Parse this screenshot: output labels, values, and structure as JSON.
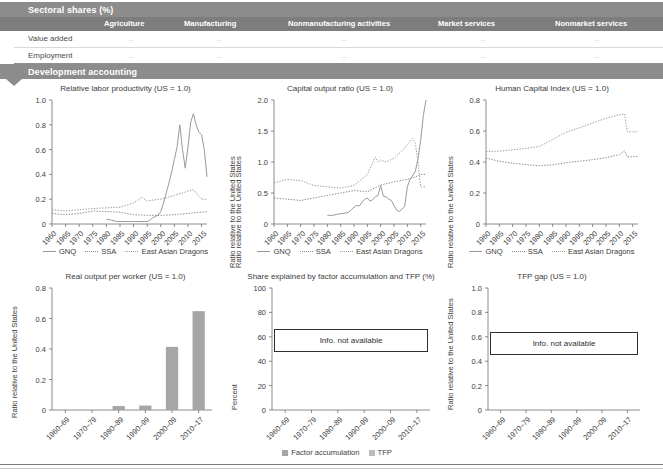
{
  "sections": {
    "sectoral": {
      "title": "Sectoral shares (%)"
    },
    "development": {
      "title": "Development accounting"
    }
  },
  "table": {
    "columns": [
      "Agriculture",
      "Manufacturing",
      "Nonmanufacturing activities",
      "Market services",
      "Nonmarket services"
    ],
    "rows": [
      {
        "label": "Value added",
        "values": [
          "..",
          "..",
          "..",
          "..",
          ".."
        ]
      },
      {
        "label": "Employment",
        "values": [
          "..",
          "..",
          "..",
          "..",
          ".."
        ]
      }
    ]
  },
  "line_legend": {
    "gnq": "GNQ",
    "ssa": "SSA",
    "dragons": "East Asian Dragons"
  },
  "bar_legend": {
    "factor": "Factor accumulation",
    "tfp": "TFP"
  },
  "not_available_text": "Info. not available",
  "colors": {
    "banner": "#8c8c8c",
    "table_header": "#7d7d7d",
    "gnq_line": "#9a9a9a",
    "ssa_line": "#8a8a8a",
    "dragons_line": "#9e9e9e",
    "bar_fill": "#a6a6a6",
    "text": "#3d3d3d"
  },
  "chart_data": [
    {
      "id": "relative-labor-productivity",
      "type": "line",
      "title": "Relative labor productivity (US = 1.0)",
      "xlabel": "",
      "ylabel": "Ratio relative to the United States",
      "ylim": [
        0,
        1.0
      ],
      "yticks": [
        "0",
        "0.2",
        "0.4",
        "0.6",
        "0.8",
        "1.0"
      ],
      "ytick_values": [
        0,
        0.2,
        0.4,
        0.6,
        0.8,
        1.0
      ],
      "xticks": [
        "1960",
        "1965",
        "1970",
        "1975",
        "1980",
        "1985",
        "1990",
        "1995",
        "2000",
        "2005",
        "2010",
        "2015"
      ],
      "xlim": [
        1960,
        2017
      ],
      "grid": false,
      "legend_position": "bottom",
      "series": [
        {
          "name": "GNQ",
          "style": "solid",
          "x": [
            1980,
            1982,
            1984,
            1986,
            1988,
            1990,
            1992,
            1994,
            1995,
            1996,
            1997,
            1998,
            1999,
            2000,
            2001,
            2002,
            2003,
            2004,
            2005,
            2006,
            2007,
            2008,
            2009,
            2010,
            2011,
            2012,
            2013,
            2014,
            2015,
            2016,
            2017
          ],
          "values": [
            0.04,
            0.03,
            0.02,
            0.02,
            0.02,
            0.02,
            0.02,
            0.02,
            0.02,
            0.03,
            0.05,
            0.06,
            0.07,
            0.1,
            0.17,
            0.25,
            0.33,
            0.42,
            0.52,
            0.62,
            0.8,
            0.6,
            0.45,
            0.62,
            0.82,
            0.89,
            0.8,
            0.74,
            0.72,
            0.6,
            0.38
          ]
        },
        {
          "name": "SSA",
          "style": "dotted",
          "x": [
            1960,
            1965,
            1970,
            1975,
            1980,
            1985,
            1990,
            1995,
            2000,
            2005,
            2010,
            2015,
            2017
          ],
          "values": [
            0.085,
            0.075,
            0.085,
            0.105,
            0.1,
            0.095,
            0.075,
            0.07,
            0.07,
            0.075,
            0.085,
            0.095,
            0.1
          ]
        },
        {
          "name": "East Asian Dragons",
          "style": "dotted",
          "x": [
            1960,
            1965,
            1970,
            1975,
            1980,
            1985,
            1990,
            1993,
            1995,
            1996,
            2000,
            2005,
            2010,
            2012,
            2013,
            2015,
            2017
          ],
          "values": [
            0.115,
            0.105,
            0.115,
            0.125,
            0.13,
            0.135,
            0.17,
            0.215,
            0.185,
            0.19,
            0.2,
            0.23,
            0.265,
            0.275,
            0.25,
            0.2,
            0.2
          ]
        }
      ]
    },
    {
      "id": "capital-output-ratio",
      "type": "line",
      "title": "Capital output ratio (US = 1.0)",
      "xlabel": "",
      "ylabel": "Ratio relative to the United States",
      "ylim": [
        0,
        2.0
      ],
      "yticks": [
        "0",
        "0.5",
        "1.0",
        "1.5",
        "2.0"
      ],
      "ytick_values": [
        0,
        0.5,
        1.0,
        1.5,
        2.0
      ],
      "xticks": [
        "1960",
        "1965",
        "1970",
        "1975",
        "1980",
        "1985",
        "1990",
        "1995",
        "2000",
        "2005",
        "2010",
        "2015"
      ],
      "xlim": [
        1960,
        2017
      ],
      "grid": false,
      "legend_position": "bottom",
      "series": [
        {
          "name": "GNQ",
          "style": "solid",
          "x": [
            1980,
            1982,
            1984,
            1986,
            1988,
            1990,
            1991,
            1992,
            1994,
            1995,
            1996,
            1997,
            1998,
            1999,
            2000,
            2001,
            2002,
            2003,
            2004,
            2005,
            2006,
            2007,
            2008,
            2009,
            2010,
            2011,
            2012,
            2013,
            2014,
            2015,
            2016,
            2017
          ],
          "values": [
            0.14,
            0.14,
            0.16,
            0.17,
            0.19,
            0.27,
            0.3,
            0.29,
            0.4,
            0.42,
            0.37,
            0.39,
            0.44,
            0.46,
            0.62,
            0.45,
            0.44,
            0.4,
            0.38,
            0.3,
            0.22,
            0.2,
            0.24,
            0.28,
            0.6,
            0.72,
            0.78,
            0.85,
            1.05,
            1.35,
            1.75,
            2.0
          ]
        },
        {
          "name": "SSA",
          "style": "dotted",
          "x": [
            1960,
            1965,
            1970,
            1975,
            1980,
            1985,
            1990,
            1995,
            2000,
            2005,
            2010,
            2013,
            2015,
            2017
          ],
          "values": [
            0.42,
            0.4,
            0.38,
            0.42,
            0.46,
            0.5,
            0.54,
            0.52,
            0.63,
            0.68,
            0.72,
            0.76,
            0.8,
            0.8
          ]
        },
        {
          "name": "East Asian Dragons",
          "style": "dotted",
          "x": [
            1960,
            1965,
            1970,
            1975,
            1980,
            1985,
            1990,
            1995,
            1998,
            1999,
            2000,
            2002,
            2005,
            2008,
            2010,
            2012,
            2013,
            2014,
            2015,
            2017
          ],
          "values": [
            0.66,
            0.72,
            0.7,
            0.62,
            0.6,
            0.58,
            0.62,
            0.8,
            1.08,
            1.0,
            1.03,
            1.0,
            1.06,
            1.18,
            1.28,
            1.38,
            1.3,
            1.0,
            0.6,
            0.6
          ]
        }
      ]
    },
    {
      "id": "human-capital-index",
      "type": "line",
      "title": "Human Capital Index (US = 1.0)",
      "xlabel": "",
      "ylabel": "Ratio relative to the United States",
      "ylim": [
        0,
        0.8
      ],
      "yticks": [
        "0",
        "0.2",
        "0.4",
        "0.6",
        "0.8"
      ],
      "ytick_values": [
        0,
        0.2,
        0.4,
        0.6,
        0.8
      ],
      "xticks": [
        "1960",
        "1965",
        "1970",
        "1975",
        "1980",
        "1985",
        "1990",
        "1995",
        "2000",
        "2005",
        "2010",
        "2015"
      ],
      "xlim": [
        1960,
        2017
      ],
      "grid": false,
      "legend_position": "bottom",
      "series": [
        {
          "name": "GNQ",
          "style": "solid",
          "x": [],
          "values": []
        },
        {
          "name": "SSA",
          "style": "dotted",
          "x": [
            1960,
            1965,
            1970,
            1975,
            1980,
            1985,
            1990,
            1995,
            2000,
            2005,
            2010,
            2012,
            2013,
            2015,
            2017
          ],
          "values": [
            0.425,
            0.405,
            0.392,
            0.383,
            0.375,
            0.382,
            0.395,
            0.405,
            0.415,
            0.428,
            0.448,
            0.472,
            0.432,
            0.435,
            0.435
          ]
        },
        {
          "name": "East Asian Dragons",
          "style": "dotted",
          "x": [
            1960,
            1965,
            1970,
            1975,
            1980,
            1985,
            1990,
            1995,
            2000,
            2005,
            2010,
            2012,
            2013,
            2015,
            2017
          ],
          "values": [
            0.468,
            0.47,
            0.478,
            0.488,
            0.5,
            0.545,
            0.592,
            0.62,
            0.652,
            0.682,
            0.705,
            0.71,
            0.595,
            0.595,
            0.595
          ]
        }
      ]
    },
    {
      "id": "real-output-per-worker",
      "type": "bar",
      "title": "Real output per worker (US = 1.0)",
      "xlabel": "",
      "ylabel": "Ratio relative to the United States",
      "ylim": [
        0,
        0.8
      ],
      "yticks": [
        "0",
        "0.2",
        "0.4",
        "0.6",
        "0.8"
      ],
      "ytick_values": [
        0,
        0.2,
        0.4,
        0.6,
        0.8
      ],
      "categories": [
        "1960–69",
        "1970–79",
        "1980–89",
        "1990–99",
        "2000–09",
        "2010–17"
      ],
      "values": [
        0,
        0,
        0.026,
        0.029,
        0.414,
        0.648
      ],
      "grid": false
    },
    {
      "id": "share-factor-accumulation-tfp",
      "type": "bar",
      "title": "Share explained by factor accumulation and TFP (%)",
      "xlabel": "",
      "ylabel": "Percent",
      "ylim": [
        0,
        100
      ],
      "yticks": [
        "0",
        "20",
        "40",
        "60",
        "80",
        "100"
      ],
      "ytick_values": [
        0,
        20,
        40,
        60,
        80,
        100
      ],
      "categories": [
        "1960–69",
        "1970–79",
        "1980–89",
        "1990–99",
        "2000–09",
        "2010–17"
      ],
      "series": [
        {
          "name": "Factor accumulation",
          "values": []
        },
        {
          "name": "TFP",
          "values": []
        }
      ],
      "annotation": "Info. not available",
      "grid": false,
      "legend_position": "bottom"
    },
    {
      "id": "tfp-gap",
      "type": "bar",
      "title": "TFP gap (US = 1.0)",
      "xlabel": "",
      "ylabel": "Ratio relative to the United States",
      "ylim": [
        0,
        1.0
      ],
      "yticks": [
        "0",
        "0.2",
        "0.4",
        "0.6",
        "0.8",
        "1.0"
      ],
      "ytick_values": [
        0,
        0.2,
        0.4,
        0.6,
        0.8,
        1.0
      ],
      "categories": [
        "1960–69",
        "1970–79",
        "1980–89",
        "1990–99",
        "2000–09",
        "2010–17"
      ],
      "values": [],
      "annotation": "Info. not available",
      "grid": false
    }
  ]
}
